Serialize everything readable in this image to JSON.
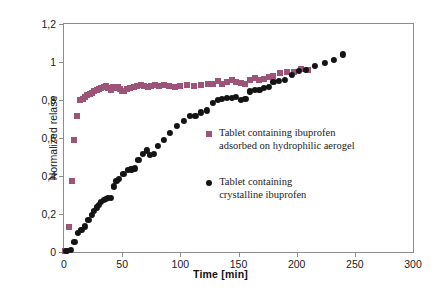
{
  "chart_data": {
    "type": "scatter",
    "title": "",
    "xlabel": "Time [min]",
    "ylabel": "Normalized relase",
    "xlim": [
      0,
      300
    ],
    "ylim": [
      0,
      1.2
    ],
    "xticks": [
      0,
      50,
      100,
      150,
      200,
      250,
      300
    ],
    "xticklabels": [
      "0",
      "50",
      "100",
      "150",
      "200",
      "250",
      "300"
    ],
    "yticks": [
      0,
      0.2,
      0.4,
      0.6,
      0.8,
      1,
      1.2
    ],
    "yticklabels": [
      "0",
      "0,2",
      "0,4",
      "0,6",
      "0,8",
      "1",
      "1,2"
    ],
    "grid": false,
    "legend_position": "inside-right",
    "series": [
      {
        "name": "Tablet containing ibuprofen adsorbed on hydrophilic aerogel",
        "marker": "square",
        "color": "#9C5578",
        "points": [
          [
            1,
            0.005
          ],
          [
            4,
            0.13
          ],
          [
            7,
            0.375
          ],
          [
            9,
            0.59
          ],
          [
            11,
            0.715
          ],
          [
            14,
            0.8
          ],
          [
            16,
            0.805
          ],
          [
            18,
            0.815
          ],
          [
            20,
            0.825
          ],
          [
            22,
            0.83
          ],
          [
            24,
            0.835
          ],
          [
            26,
            0.845
          ],
          [
            28,
            0.855
          ],
          [
            30,
            0.86
          ],
          [
            32,
            0.865
          ],
          [
            34,
            0.87
          ],
          [
            36,
            0.875
          ],
          [
            38,
            0.865
          ],
          [
            40,
            0.855
          ],
          [
            42,
            0.87
          ],
          [
            44,
            0.865
          ],
          [
            46,
            0.87
          ],
          [
            48,
            0.86
          ],
          [
            50,
            0.845
          ],
          [
            52,
            0.85
          ],
          [
            54,
            0.86
          ],
          [
            57,
            0.865
          ],
          [
            60,
            0.87
          ],
          [
            63,
            0.875
          ],
          [
            66,
            0.88
          ],
          [
            69,
            0.875
          ],
          [
            72,
            0.87
          ],
          [
            75,
            0.875
          ],
          [
            78,
            0.88
          ],
          [
            82,
            0.875
          ],
          [
            86,
            0.88
          ],
          [
            90,
            0.875
          ],
          [
            95,
            0.87
          ],
          [
            100,
            0.875
          ],
          [
            106,
            0.88
          ],
          [
            112,
            0.875
          ],
          [
            118,
            0.88
          ],
          [
            124,
            0.885
          ],
          [
            128,
            0.885
          ],
          [
            132,
            0.9
          ],
          [
            136,
            0.885
          ],
          [
            140,
            0.895
          ],
          [
            144,
            0.905
          ],
          [
            148,
            0.895
          ],
          [
            152,
            0.89
          ],
          [
            156,
            0.885
          ],
          [
            160,
            0.905
          ],
          [
            164,
            0.915
          ],
          [
            168,
            0.905
          ],
          [
            172,
            0.91
          ],
          [
            176,
            0.92
          ],
          [
            180,
            0.925
          ],
          [
            186,
            0.94
          ],
          [
            192,
            0.95
          ],
          [
            198,
            0.945
          ],
          [
            204,
            0.965
          ],
          [
            210,
            0.96
          ]
        ]
      },
      {
        "name": "Tablet containing crystalline ibuprofen",
        "marker": "circle",
        "color": "#141414",
        "points": [
          [
            2,
            0.005
          ],
          [
            6,
            0.01
          ],
          [
            9,
            0.055
          ],
          [
            12,
            0.1
          ],
          [
            15,
            0.115
          ],
          [
            18,
            0.135
          ],
          [
            21,
            0.17
          ],
          [
            24,
            0.195
          ],
          [
            26,
            0.215
          ],
          [
            28,
            0.235
          ],
          [
            30,
            0.25
          ],
          [
            32,
            0.265
          ],
          [
            34,
            0.275
          ],
          [
            36,
            0.28
          ],
          [
            38,
            0.285
          ],
          [
            40,
            0.285
          ],
          [
            43,
            0.345
          ],
          [
            45,
            0.375
          ],
          [
            47,
            0.385
          ],
          [
            51,
            0.41
          ],
          [
            55,
            0.43
          ],
          [
            58,
            0.435
          ],
          [
            61,
            0.44
          ],
          [
            64,
            0.485
          ],
          [
            68,
            0.515
          ],
          [
            71,
            0.535
          ],
          [
            74,
            0.51
          ],
          [
            77,
            0.515
          ],
          [
            81,
            0.56
          ],
          [
            86,
            0.59
          ],
          [
            91,
            0.625
          ],
          [
            97,
            0.665
          ],
          [
            103,
            0.69
          ],
          [
            108,
            0.715
          ],
          [
            113,
            0.715
          ],
          [
            118,
            0.735
          ],
          [
            123,
            0.745
          ],
          [
            128,
            0.785
          ],
          [
            132,
            0.8
          ],
          [
            136,
            0.805
          ],
          [
            140,
            0.81
          ],
          [
            144,
            0.81
          ],
          [
            148,
            0.815
          ],
          [
            152,
            0.8
          ],
          [
            156,
            0.805
          ],
          [
            160,
            0.845
          ],
          [
            164,
            0.855
          ],
          [
            168,
            0.855
          ],
          [
            172,
            0.865
          ],
          [
            176,
            0.87
          ],
          [
            180,
            0.895
          ],
          [
            185,
            0.9
          ],
          [
            190,
            0.905
          ],
          [
            196,
            0.93
          ],
          [
            202,
            0.955
          ],
          [
            208,
            0.96
          ],
          [
            216,
            0.98
          ],
          [
            224,
            0.995
          ],
          [
            232,
            1.01
          ],
          [
            240,
            1.04
          ]
        ]
      }
    ]
  },
  "legend": {
    "entries": [
      {
        "line1": "Tablet containing ibuprofen",
        "line2": "adsorbed on hydrophilic aerogel",
        "color": "#9C5578",
        "marker": "square"
      },
      {
        "line1": "Tablet containing",
        "line2": "crystalline ibuprofen",
        "color": "#141414",
        "marker": "circle"
      }
    ]
  },
  "style": {
    "background": "#ffffff",
    "axis_color": "#8d8d8d",
    "text_color": "#1a1a1a",
    "series_a_color": "#9C5578",
    "series_b_color": "#141414"
  }
}
